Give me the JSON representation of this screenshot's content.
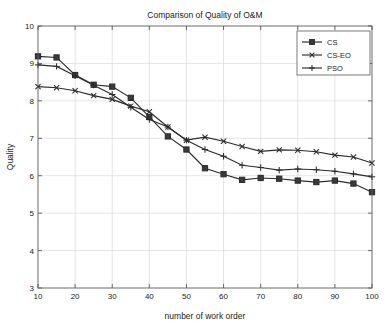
{
  "chart_data": {
    "type": "line",
    "title": "Comparison of Quality of O&M",
    "xlabel": "number of work order",
    "ylabel": "Quality",
    "xlim": [
      10,
      100
    ],
    "ylim": [
      3,
      10
    ],
    "xticks": [
      10,
      20,
      30,
      40,
      50,
      60,
      70,
      80,
      90,
      100
    ],
    "yticks": [
      3,
      4,
      5,
      6,
      7,
      8,
      9,
      10
    ],
    "grid": true,
    "legend_position": "top-right",
    "x": [
      10,
      15,
      20,
      25,
      30,
      35,
      40,
      45,
      50,
      55,
      60,
      65,
      70,
      75,
      80,
      85,
      90,
      95,
      100
    ],
    "series": [
      {
        "name": "CS",
        "marker": "square",
        "values": [
          9.19,
          9.16,
          8.69,
          8.43,
          8.38,
          8.08,
          7.57,
          7.05,
          6.7,
          6.2,
          6.04,
          5.89,
          5.94,
          5.92,
          5.87,
          5.83,
          5.87,
          5.79,
          5.56
        ]
      },
      {
        "name": "CS-EO",
        "marker": "x",
        "values": [
          8.38,
          8.35,
          8.27,
          8.14,
          8.04,
          7.86,
          7.71,
          7.3,
          6.95,
          7.03,
          6.92,
          6.78,
          6.65,
          6.69,
          6.68,
          6.64,
          6.55,
          6.5,
          6.34
        ]
      },
      {
        "name": "PSO",
        "marker": "plus",
        "values": [
          8.96,
          8.92,
          8.67,
          8.42,
          8.17,
          7.83,
          7.5,
          7.3,
          6.95,
          6.7,
          6.52,
          6.28,
          6.22,
          6.15,
          6.18,
          6.16,
          6.12,
          6.05,
          5.97
        ]
      }
    ]
  },
  "legend": {
    "items": [
      {
        "label": "CS"
      },
      {
        "label": "CS-EO"
      },
      {
        "label": "PSO"
      }
    ]
  }
}
